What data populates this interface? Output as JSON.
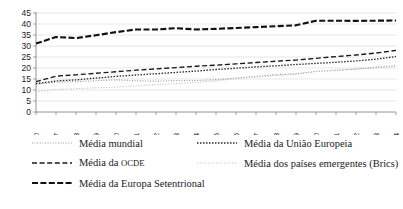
{
  "chart_data": {
    "type": "line",
    "title": "",
    "subtitle": "",
    "xlabel": "",
    "ylabel": "",
    "grid": true,
    "legend_position": "bottom",
    "ylim": [
      0,
      45
    ],
    "yticks": [
      0,
      5,
      10,
      15,
      20,
      25,
      30,
      35,
      40,
      45
    ],
    "categories": [
      "1990",
      "1997",
      "1998",
      "1999",
      "2000",
      "2001",
      "2002",
      "2003",
      "2004",
      "2005",
      "2006",
      "2007",
      "2008",
      "2009",
      "2010",
      "2011",
      "2012",
      "2013",
      "2014"
    ],
    "series": [
      {
        "name": "Média mundial",
        "style": "fine-dotted",
        "color": "#8f8f8f",
        "values": [
          12.6,
          13.5,
          13.8,
          14.2,
          14.6,
          14.2,
          14.0,
          14.3,
          14.3,
          14.7,
          15.4,
          16.2,
          17.0,
          17.4,
          18.4,
          19.0,
          19.6,
          20.4,
          21.1
        ]
      },
      {
        "name": "Média da União Europeia",
        "style": "dotted",
        "color": "#2b2b2b",
        "values": [
          12.9,
          14.1,
          14.6,
          15.4,
          16.2,
          16.8,
          17.4,
          18.0,
          18.6,
          19.3,
          19.9,
          20.5,
          21.0,
          21.6,
          22.1,
          22.6,
          23.2,
          24.0,
          25.2
        ]
      },
      {
        "name": "Média da OCDE",
        "style": "dashed",
        "color": "#1a1a1a",
        "values": [
          13.8,
          16.3,
          16.9,
          17.6,
          18.3,
          19.0,
          19.6,
          20.2,
          20.8,
          21.3,
          21.9,
          22.5,
          23.1,
          23.6,
          24.4,
          25.2,
          25.9,
          26.8,
          28.0
        ]
      },
      {
        "name": "Média dos países emergentes (Brics)",
        "style": "faint-dotted",
        "color": "#c2c2c2",
        "values": [
          9.2,
          10.2,
          10.6,
          11.0,
          11.3,
          11.9,
          12.4,
          12.9,
          13.4,
          14.2,
          15.1,
          15.9,
          16.6,
          17.1,
          18.5,
          18.9,
          19.4,
          20.0,
          20.6
        ]
      },
      {
        "name": "Média da Europa Setentrional",
        "style": "thick-dashed",
        "color": "#111111",
        "values": [
          31.1,
          34.1,
          33.6,
          34.9,
          36.3,
          37.5,
          37.5,
          38.1,
          37.5,
          37.8,
          38.2,
          38.6,
          39.0,
          39.4,
          41.5,
          41.5,
          41.4,
          41.5,
          41.6
        ]
      }
    ]
  },
  "legend": {
    "left_items": [
      {
        "label": "Média mundial",
        "style": "fine-dotted"
      },
      {
        "label": "Média da OCDE",
        "style": "dashed"
      },
      {
        "label": "Média da Europa Setentrional",
        "style": "thick-dashed"
      }
    ],
    "right_items": [
      {
        "label": "Média da União Europeia",
        "style": "dotted"
      },
      {
        "label": "Média dos países emergentes (Brics)",
        "style": "faint-dotted"
      }
    ]
  }
}
